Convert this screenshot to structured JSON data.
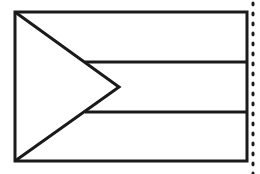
{
  "figure": {
    "width": 260,
    "height": 174,
    "colors": {
      "background": "#ffffff",
      "stroke": "#1a1a1a"
    },
    "flag_rect": {
      "x": 15,
      "y": 12,
      "w": 232,
      "h": 149,
      "stroke_width": 3
    },
    "stripes_y": [
      62,
      112
    ],
    "stripe_start_x": 85,
    "chevron": {
      "top_left": [
        15,
        12
      ],
      "tip": [
        119,
        87
      ],
      "bottom_left": [
        15,
        161
      ],
      "stroke_width": 3
    },
    "dotted_edge": {
      "x": 253,
      "y1": 2,
      "y2": 172,
      "dot_gap": 10,
      "dot_radius": 1.6
    }
  }
}
